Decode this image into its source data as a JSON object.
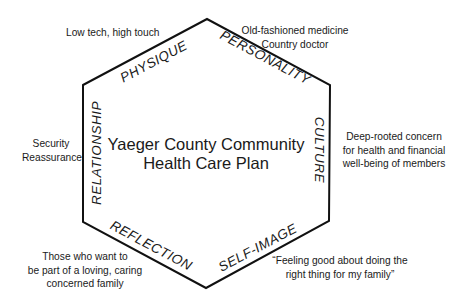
{
  "diagram": {
    "title_lines": [
      "Yaeger County Community",
      "Health Care Plan"
    ],
    "shape": "hexagon",
    "stroke_color": "#111111",
    "vertices": [
      [
        83,
        85
      ],
      [
        207,
        19
      ],
      [
        330,
        85
      ],
      [
        329,
        221
      ],
      [
        206,
        288
      ],
      [
        83,
        222
      ]
    ],
    "edges": [
      {
        "label": "PHYSIQUE",
        "note_lines": [
          "Low tech, high touch"
        ]
      },
      {
        "label": "PERSONALITY",
        "note_lines": [
          "Old-fashioned medicine",
          "Country doctor"
        ]
      },
      {
        "label": "CULTURE",
        "note_lines": [
          "Deep-rooted concern",
          "for health and financial",
          "well-being of members"
        ]
      },
      {
        "label": "SELF-IMAGE",
        "note_lines": [
          "“Feeling good about doing the",
          "right thing for my family”"
        ]
      },
      {
        "label": "REFLECTION",
        "note_lines": [
          "Those who want to",
          "be part of a loving, caring",
          "concerned family"
        ]
      },
      {
        "label": "RELATIONSHIP",
        "note_lines": [
          "Security",
          "Reassurance"
        ]
      }
    ]
  }
}
